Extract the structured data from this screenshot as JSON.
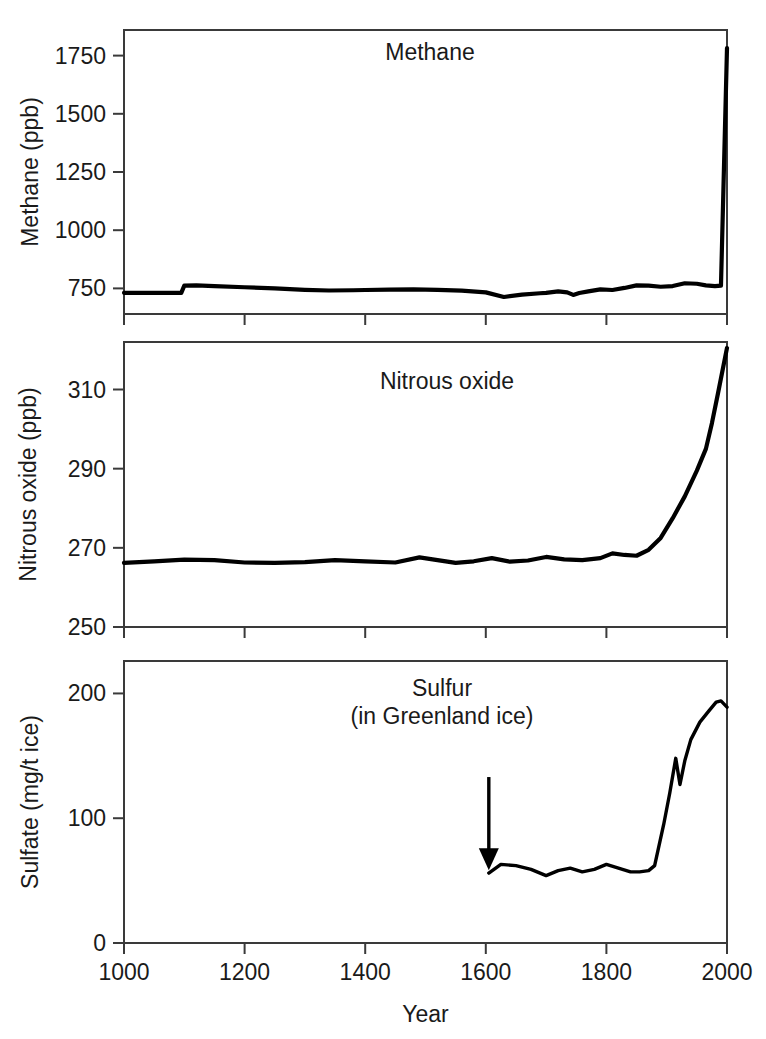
{
  "figure": {
    "background": "#ffffff",
    "line_color": "#000000",
    "axis_color": "#3a3a3a",
    "text_color": "#1a1a1a",
    "xlabel": "Year",
    "caption_partial": ""
  },
  "chart_data": [
    {
      "type": "line",
      "panel": "methane",
      "title": "Methane",
      "xlabel": "",
      "ylabel": "Methane (ppb)",
      "xlim": [
        1000,
        2000
      ],
      "ylim": [
        640,
        1860
      ],
      "xticks": [
        1000,
        1200,
        1400,
        1600,
        1800,
        2000
      ],
      "yticks": [
        750,
        1000,
        1250,
        1500,
        1750
      ],
      "grid": false,
      "legend": "none",
      "x": [
        1000,
        1040,
        1080,
        1095,
        1100,
        1120,
        1150,
        1200,
        1250,
        1300,
        1340,
        1380,
        1400,
        1440,
        1480,
        1520,
        1560,
        1600,
        1630,
        1660,
        1690,
        1700,
        1720,
        1735,
        1745,
        1755,
        1770,
        1790,
        1810,
        1830,
        1850,
        1870,
        1890,
        1910,
        1930,
        1950,
        1965,
        1980,
        1990,
        2000
      ],
      "values": [
        731,
        731,
        731,
        731,
        762,
        763,
        760,
        755,
        750,
        744,
        741,
        742,
        743,
        745,
        746,
        744,
        740,
        733,
        713,
        723,
        729,
        731,
        737,
        733,
        722,
        730,
        737,
        746,
        743,
        752,
        763,
        762,
        757,
        760,
        772,
        770,
        763,
        760,
        762,
        1782
      ]
    },
    {
      "type": "line",
      "panel": "nitrous_oxide",
      "title": "Nitrous oxide",
      "xlabel": "",
      "ylabel": "Nitrous oxide (ppb)",
      "xlim": [
        1000,
        2000
      ],
      "ylim": [
        250,
        322
      ],
      "xticks": [
        1000,
        1200,
        1400,
        1600,
        1800,
        2000
      ],
      "yticks": [
        250,
        270,
        290,
        310
      ],
      "grid": false,
      "legend": "none",
      "x": [
        1000,
        1050,
        1100,
        1150,
        1200,
        1250,
        1300,
        1350,
        1400,
        1450,
        1490,
        1520,
        1550,
        1580,
        1610,
        1640,
        1670,
        1700,
        1730,
        1760,
        1790,
        1810,
        1830,
        1850,
        1870,
        1890,
        1910,
        1930,
        1950,
        1965,
        1975,
        1985,
        2000
      ],
      "values": [
        266.2,
        266.6,
        267.0,
        266.9,
        266.3,
        266.2,
        266.4,
        266.9,
        266.6,
        266.3,
        267.6,
        266.9,
        266.2,
        266.6,
        267.4,
        266.5,
        266.8,
        267.7,
        267.1,
        266.9,
        267.4,
        268.6,
        268.2,
        268.0,
        269.5,
        272.5,
        277.5,
        283.0,
        289.5,
        295.0,
        301.5,
        309.0,
        320.5
      ]
    },
    {
      "type": "line",
      "panel": "sulfur",
      "title": "Sulfur",
      "subtitle": "(in Greenland ice)",
      "xlabel": "Year",
      "ylabel": "Sulfate (mg/t ice)",
      "xlim": [
        1000,
        2000
      ],
      "ylim": [
        0,
        226
      ],
      "xticks": [
        1000,
        1200,
        1400,
        1600,
        1800,
        2000
      ],
      "yticks": [
        0,
        100,
        200
      ],
      "grid": false,
      "legend": "none",
      "annotation": {
        "type": "arrow",
        "label": "",
        "x": 1605,
        "y_from": 133,
        "y_to": 60,
        "direction": "down"
      },
      "x": [
        1605,
        1625,
        1650,
        1675,
        1700,
        1720,
        1740,
        1760,
        1780,
        1800,
        1820,
        1840,
        1855,
        1870,
        1880,
        1895,
        1905,
        1915,
        1922,
        1930,
        1940,
        1955,
        1970,
        1982,
        1990,
        2000
      ],
      "values": [
        56,
        63,
        62,
        59,
        54,
        58,
        60,
        57,
        59,
        63,
        60,
        57,
        57,
        58,
        62,
        95,
        120,
        148,
        127,
        146,
        163,
        177,
        186,
        193,
        194,
        189
      ]
    }
  ],
  "panels": {
    "methane": {
      "geometry": {
        "left": 124,
        "right": 727,
        "top": 30,
        "bottom": 314
      }
    },
    "nitrous_oxide": {
      "geometry": {
        "left": 124,
        "right": 727,
        "top": 342,
        "bottom": 627
      }
    },
    "sulfur": {
      "geometry": {
        "left": 124,
        "right": 727,
        "top": 661,
        "bottom": 943
      }
    }
  },
  "labels": {
    "methane_title": "Methane",
    "methane_ylabel": "Methane (ppb)",
    "n2o_title": "Nitrous oxide",
    "n2o_ylabel": "Nitrous oxide (ppb)",
    "sulfur_title": "Sulfur",
    "sulfur_subtitle": "(in Greenland ice)",
    "sulfur_ylabel": "Sulfate (mg/t ice)",
    "xaxis_title": "Year"
  }
}
